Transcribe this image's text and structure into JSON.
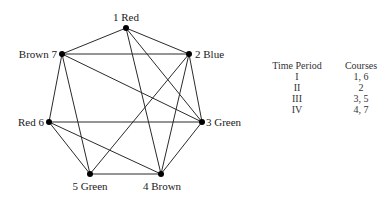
{
  "graph": {
    "nodes": [
      {
        "id": 1,
        "label": "1 Red",
        "color_name": "Red",
        "x": 126,
        "y": 28,
        "label_x": 126,
        "label_y": 21,
        "anchor": "middle"
      },
      {
        "id": 2,
        "label": "2 Blue",
        "color_name": "Blue",
        "x": 189,
        "y": 54,
        "label_x": 195,
        "label_y": 58,
        "anchor": "start"
      },
      {
        "id": 3,
        "label": "3 Green",
        "color_name": "Green",
        "x": 202,
        "y": 122,
        "label_x": 206,
        "label_y": 126,
        "anchor": "start"
      },
      {
        "id": 4,
        "label": "4 Brown",
        "color_name": "Brown",
        "x": 161,
        "y": 174,
        "label_x": 162,
        "label_y": 190,
        "anchor": "middle"
      },
      {
        "id": 5,
        "label": "5 Green",
        "color_name": "Green",
        "x": 90,
        "y": 174,
        "label_x": 90,
        "label_y": 190,
        "anchor": "middle"
      },
      {
        "id": 6,
        "label": "Red 6",
        "color_name": "Red",
        "x": 49,
        "y": 122,
        "label_x": 44,
        "label_y": 126,
        "anchor": "end"
      },
      {
        "id": 7,
        "label": "Brown 7",
        "color_name": "Brown",
        "x": 62,
        "y": 54,
        "label_x": 57,
        "label_y": 58,
        "anchor": "end"
      }
    ],
    "edges": [
      [
        1,
        7
      ],
      [
        1,
        2
      ],
      [
        1,
        3
      ],
      [
        1,
        4
      ],
      [
        7,
        2
      ],
      [
        7,
        3
      ],
      [
        7,
        6
      ],
      [
        7,
        5
      ],
      [
        2,
        3
      ],
      [
        2,
        4
      ],
      [
        2,
        5
      ],
      [
        6,
        3
      ],
      [
        6,
        5
      ],
      [
        6,
        4
      ],
      [
        5,
        4
      ],
      [
        3,
        4
      ]
    ]
  },
  "schedule": {
    "headers": [
      "Time Period",
      "Courses"
    ],
    "rows": [
      [
        "I",
        "1, 6"
      ],
      [
        "II",
        "2"
      ],
      [
        "III",
        "3, 5"
      ],
      [
        "IV",
        "4, 7"
      ]
    ]
  }
}
